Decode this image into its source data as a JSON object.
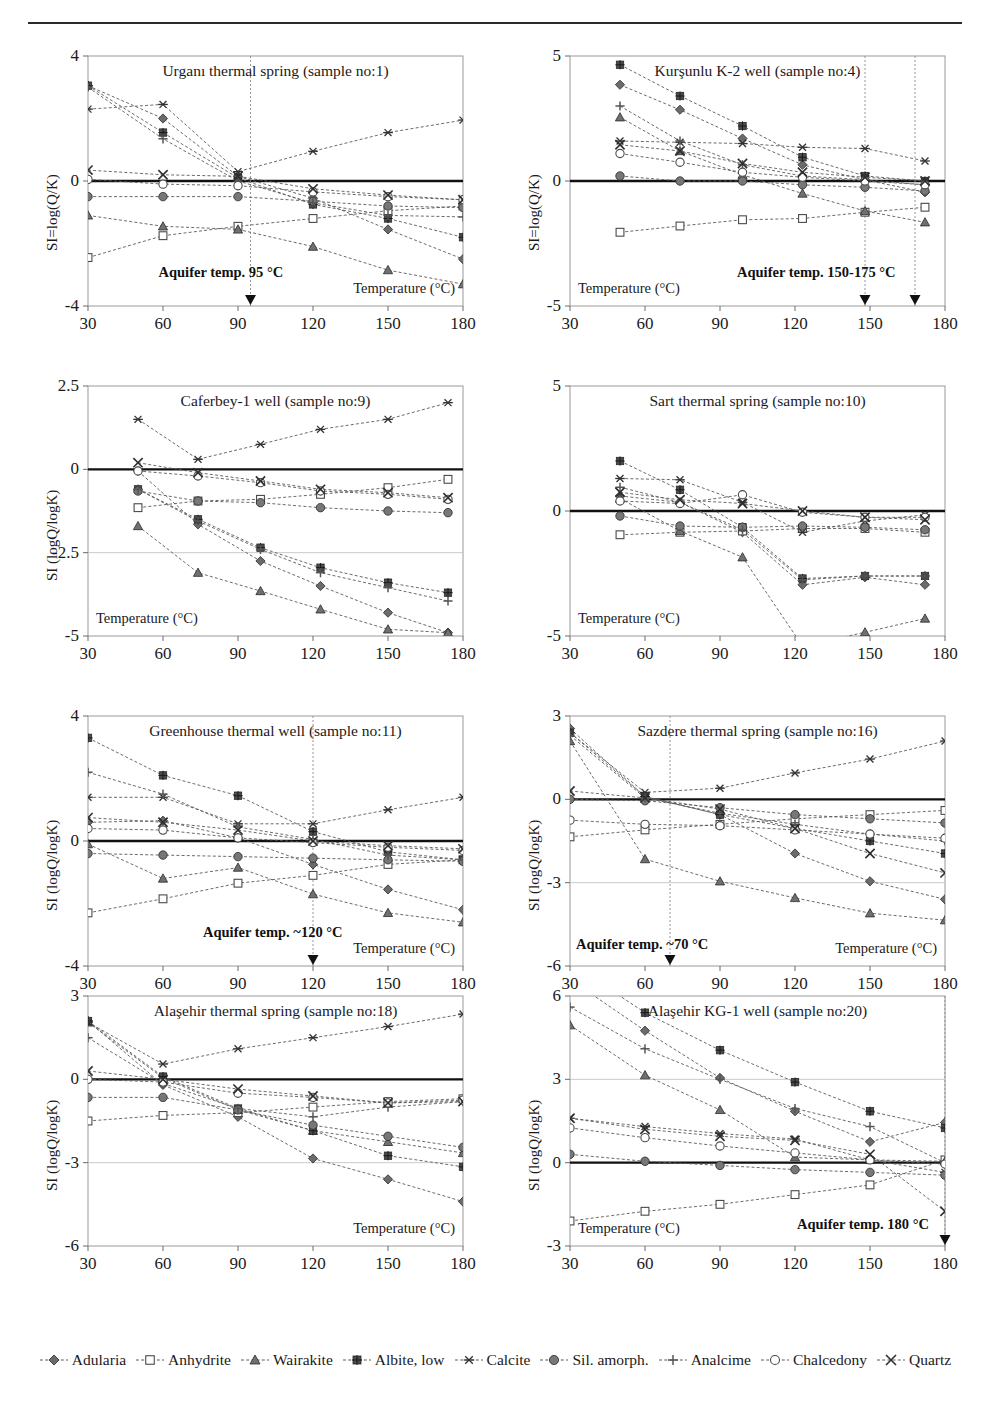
{
  "figure": {
    "xlabel": "Temperature (°C)",
    "x_ticks": [
      30,
      60,
      90,
      120,
      150,
      180
    ],
    "aquifer_prefix": "Aquifer temp."
  },
  "legend": {
    "items": [
      {
        "label": "Adularia",
        "marker": "diamond-filled",
        "color": "#6b6b6b"
      },
      {
        "label": "Anhydrite",
        "marker": "square-open",
        "color": "#8a8a8a"
      },
      {
        "label": "Wairakite",
        "marker": "triangle-filled",
        "color": "#707070"
      },
      {
        "label": "Albite, low",
        "marker": "square-star",
        "color": "#4a4a4a"
      },
      {
        "label": "Calcite",
        "marker": "asterisk",
        "color": "#333333"
      },
      {
        "label": "Sil. amorph.",
        "marker": "circle-filled",
        "color": "#777777"
      },
      {
        "label": "Analcime",
        "marker": "plus",
        "color": "#555555"
      },
      {
        "label": "Chalcedony",
        "marker": "circle-open",
        "color": "#8a8a8a"
      },
      {
        "label": "Quartz",
        "marker": "cross",
        "color": "#2e2e2e"
      }
    ]
  },
  "chart_data": [
    {
      "id": "urganli",
      "type": "line",
      "title": "Urganı thermal spring (sample no:1)",
      "xlabel": "Temperature (°C)",
      "ylabel": "SI=log(Q/K)",
      "xlim": [
        30,
        180
      ],
      "ylim": [
        -4,
        4
      ],
      "y_ticks": [
        -4,
        0,
        4
      ],
      "grid": true,
      "x": [
        30,
        60,
        90,
        120,
        150,
        180
      ],
      "aquifer": {
        "label": "Aquifer temp. 95 °C",
        "markers": [
          95
        ]
      },
      "series": [
        {
          "name": "Adularia",
          "values": [
            3.05,
            2.0,
            0.15,
            -0.55,
            -1.55,
            -2.5
          ]
        },
        {
          "name": "Anhydrite",
          "values": [
            -2.45,
            -1.75,
            -1.45,
            -1.2,
            -0.95,
            -0.8
          ]
        },
        {
          "name": "Wairakite",
          "values": [
            -1.1,
            -1.45,
            -1.55,
            -2.1,
            -2.85,
            -3.3
          ]
        },
        {
          "name": "Albite, low",
          "values": [
            3.05,
            1.55,
            0.1,
            -0.75,
            -1.2,
            -1.8
          ]
        },
        {
          "name": "Calcite",
          "values": [
            2.3,
            2.45,
            0.3,
            0.95,
            1.55,
            1.95
          ]
        },
        {
          "name": "Sil. amorph.",
          "values": [
            -0.5,
            -0.5,
            -0.5,
            -0.65,
            -0.8,
            -0.85
          ]
        },
        {
          "name": "Analcime",
          "values": [
            3.0,
            1.35,
            0.0,
            -0.7,
            -1.1,
            -1.15
          ]
        },
        {
          "name": "Chalcedony",
          "values": [
            0.05,
            -0.1,
            -0.15,
            -0.35,
            -0.5,
            -0.6
          ]
        },
        {
          "name": "Quartz",
          "values": [
            0.35,
            0.2,
            0.15,
            -0.25,
            -0.45,
            -0.6
          ]
        }
      ]
    },
    {
      "id": "kursunlu",
      "type": "line",
      "title": "Kurşunlu K-2 well (sample no:4)",
      "xlabel": "Temperature (°C)",
      "ylabel": "SI=log(Q/K)",
      "xlim": [
        30,
        180
      ],
      "ylim": [
        -5,
        5
      ],
      "y_ticks": [
        -5,
        0,
        5
      ],
      "grid": true,
      "x": [
        50,
        74,
        99,
        123,
        148,
        172
      ],
      "aquifer": {
        "label": "Aquifer temp. 150-175 °C",
        "markers": [
          148,
          168
        ]
      },
      "series": [
        {
          "name": "Adularia",
          "values": [
            3.85,
            2.85,
            1.7,
            0.65,
            0.05,
            -0.45
          ]
        },
        {
          "name": "Anhydrite",
          "values": [
            -2.05,
            -1.8,
            -1.55,
            -1.5,
            -1.25,
            -1.05
          ]
        },
        {
          "name": "Wairakite",
          "values": [
            2.55,
            1.2,
            0.25,
            -0.5,
            -1.2,
            -1.65
          ]
        },
        {
          "name": "Albite, low",
          "values": [
            4.65,
            3.4,
            2.2,
            0.95,
            0.2,
            0.0
          ]
        },
        {
          "name": "Calcite",
          "values": [
            1.6,
            1.55,
            1.5,
            1.35,
            1.3,
            0.8
          ]
        },
        {
          "name": "Sil. amorph.",
          "values": [
            0.2,
            0.0,
            0.0,
            -0.15,
            -0.25,
            -0.4
          ]
        },
        {
          "name": "Analcime",
          "values": [
            3.0,
            1.6,
            0.65,
            0.2,
            0.05,
            -0.15
          ]
        },
        {
          "name": "Chalcedony",
          "values": [
            1.1,
            0.75,
            0.35,
            0.15,
            0.0,
            -0.15
          ]
        },
        {
          "name": "Quartz",
          "values": [
            1.45,
            1.2,
            0.7,
            0.35,
            0.15,
            0.0
          ]
        }
      ]
    },
    {
      "id": "caferbey",
      "type": "line",
      "title": "Caferbey-1 well (sample no:9)",
      "xlabel": "Temperature (°C)",
      "ylabel": "SI (logQ/logK)",
      "xlim": [
        30,
        180
      ],
      "ylim": [
        -5,
        2.5
      ],
      "y_ticks": [
        -5,
        -2.5,
        0,
        2.5
      ],
      "grid": true,
      "x": [
        50,
        74,
        99,
        123,
        150,
        174
      ],
      "aquifer": null,
      "series": [
        {
          "name": "Adularia",
          "values": [
            -0.05,
            -1.65,
            -2.75,
            -3.5,
            -4.3,
            -4.9
          ]
        },
        {
          "name": "Anhydrite",
          "values": [
            -1.15,
            -0.95,
            -0.9,
            -0.75,
            -0.55,
            -0.3
          ]
        },
        {
          "name": "Wairakite",
          "values": [
            -1.7,
            -3.1,
            -3.65,
            -4.2,
            -4.8,
            -4.9
          ]
        },
        {
          "name": "Albite, low",
          "values": [
            -0.6,
            -1.5,
            -2.35,
            -2.95,
            -3.4,
            -3.7
          ]
        },
        {
          "name": "Calcite",
          "values": [
            1.5,
            0.3,
            0.75,
            1.2,
            1.5,
            2.0
          ]
        },
        {
          "name": "Sil. amorph.",
          "values": [
            -0.65,
            -0.95,
            -1.0,
            -1.15,
            -1.25,
            -1.3
          ]
        },
        {
          "name": "Analcime",
          "values": [
            -0.6,
            -1.55,
            -2.4,
            -3.1,
            -3.55,
            -3.95
          ]
        },
        {
          "name": "Chalcedony",
          "values": [
            -0.05,
            -0.2,
            -0.4,
            -0.65,
            -0.75,
            -0.9
          ]
        },
        {
          "name": "Quartz",
          "values": [
            0.2,
            -0.1,
            -0.35,
            -0.6,
            -0.7,
            -0.85
          ]
        }
      ]
    },
    {
      "id": "sart",
      "type": "line",
      "title": "Sart thermal spring (sample no:10)",
      "xlabel": "Temperature (°C)",
      "ylabel": "",
      "xlim": [
        30,
        180
      ],
      "ylim": [
        -5,
        5
      ],
      "y_ticks": [
        -5,
        0,
        5
      ],
      "grid": true,
      "x": [
        50,
        74,
        99,
        123,
        148,
        172
      ],
      "aquifer": null,
      "series": [
        {
          "name": "Adularia",
          "values": [
            0.6,
            0.35,
            -0.85,
            -2.95,
            -2.65,
            -2.95
          ]
        },
        {
          "name": "Anhydrite",
          "values": [
            -0.95,
            -0.85,
            -0.8,
            -0.7,
            -0.7,
            -0.85
          ]
        },
        {
          "name": "Wairakite",
          "values": [
            0.5,
            -0.8,
            -1.85,
            -5.4,
            -4.85,
            -4.3
          ]
        },
        {
          "name": "Albite, low",
          "values": [
            2.0,
            0.85,
            -0.65,
            -2.7,
            -2.6,
            -2.6
          ]
        },
        {
          "name": "Calcite",
          "values": [
            1.3,
            1.25,
            0.35,
            -0.85,
            -0.4,
            -0.15
          ]
        },
        {
          "name": "Sil. amorph.",
          "values": [
            -0.2,
            -0.6,
            -0.65,
            -0.6,
            -0.65,
            -0.75
          ]
        },
        {
          "name": "Analcime",
          "values": [
            0.95,
            0.35,
            -0.75,
            -2.75,
            -2.6,
            -2.6
          ]
        },
        {
          "name": "Chalcedony",
          "values": [
            0.4,
            0.3,
            0.65,
            -0.05,
            -0.25,
            -0.25
          ]
        },
        {
          "name": "Quartz",
          "values": [
            0.75,
            0.45,
            0.3,
            0.0,
            -0.25,
            -0.35
          ]
        }
      ]
    },
    {
      "id": "greenhouse",
      "type": "line",
      "title": "Greenhouse  thermal well (sample no:11)",
      "xlabel": "Temperature (°C)",
      "ylabel": "SI (logQ/logK)",
      "xlim": [
        30,
        180
      ],
      "ylim": [
        -4,
        4
      ],
      "y_ticks": [
        -4,
        0,
        4
      ],
      "grid": true,
      "x": [
        30,
        60,
        90,
        120,
        150,
        180
      ],
      "aquifer": {
        "label": "Aquifer temp.  ~120 °C",
        "markers": [
          120
        ]
      },
      "series": [
        {
          "name": "Adularia",
          "values": [
            0.6,
            0.65,
            0.1,
            -0.75,
            -1.55,
            -2.2
          ]
        },
        {
          "name": "Anhydrite",
          "values": [
            -2.3,
            -1.85,
            -1.35,
            -1.1,
            -0.75,
            -0.6
          ]
        },
        {
          "name": "Wairakite",
          "values": [
            -0.1,
            -1.2,
            -0.85,
            -1.7,
            -2.3,
            -2.6
          ]
        },
        {
          "name": "Albite, low",
          "values": [
            3.3,
            2.1,
            1.45,
            0.3,
            -0.35,
            -0.6
          ]
        },
        {
          "name": "Calcite",
          "values": [
            1.4,
            1.4,
            0.55,
            0.55,
            1.0,
            1.4
          ]
        },
        {
          "name": "Sil. amorph.",
          "values": [
            -0.4,
            -0.45,
            -0.5,
            -0.55,
            -0.6,
            -0.65
          ]
        },
        {
          "name": "Analcime",
          "values": [
            2.2,
            1.5,
            0.45,
            0.05,
            -0.45,
            -0.6
          ]
        },
        {
          "name": "Chalcedony",
          "values": [
            0.4,
            0.35,
            0.1,
            -0.05,
            -0.2,
            -0.3
          ]
        },
        {
          "name": "Quartz",
          "values": [
            0.75,
            0.6,
            0.35,
            0.0,
            -0.15,
            -0.25
          ]
        }
      ]
    },
    {
      "id": "sazdere",
      "type": "line",
      "title": "Sazdere thermal spring (sample no:16)",
      "xlabel": "Temperature (°C)",
      "ylabel": "SI (logQ/logK)",
      "xlim": [
        30,
        180
      ],
      "ylim": [
        -6,
        3
      ],
      "y_ticks": [
        -6,
        -3,
        0,
        3
      ],
      "grid": true,
      "x": [
        30,
        60,
        90,
        120,
        150,
        180
      ],
      "aquifer": {
        "label": "Aquifer temp.  ~70 °C",
        "markers": [
          70
        ]
      },
      "series": [
        {
          "name": "Adularia",
          "values": [
            2.55,
            0.1,
            -0.55,
            -1.95,
            -2.95,
            -3.6
          ]
        },
        {
          "name": "Anhydrite",
          "values": [
            -1.35,
            -1.1,
            -0.9,
            -0.7,
            -0.55,
            -0.4
          ]
        },
        {
          "name": "Wairakite",
          "values": [
            2.1,
            -2.15,
            -2.95,
            -3.55,
            -4.1,
            -4.35
          ]
        },
        {
          "name": "Albite, low",
          "values": [
            2.4,
            0.1,
            -0.55,
            -1.05,
            -1.5,
            -1.95
          ]
        },
        {
          "name": "Calcite",
          "values": [
            2.4,
            0.25,
            0.4,
            0.95,
            1.45,
            2.1
          ]
        },
        {
          "name": "Sil. amorph.",
          "values": [
            0.0,
            -0.05,
            -0.3,
            -0.55,
            -0.7,
            -0.85
          ]
        },
        {
          "name": "Analcime",
          "values": [
            2.3,
            0.05,
            -0.5,
            -0.9,
            -1.25,
            -1.5
          ]
        },
        {
          "name": "Chalcedony",
          "values": [
            -0.75,
            -0.9,
            -0.95,
            -1.1,
            -1.25,
            -1.4
          ]
        },
        {
          "name": "Quartz",
          "values": [
            0.3,
            0.05,
            -0.35,
            -1.05,
            -1.95,
            -2.65
          ]
        }
      ]
    },
    {
      "id": "alasehir-spring",
      "type": "line",
      "title": "Alaşehir thermal spring (sample no:18)",
      "xlabel": "Temperature (°C)",
      "ylabel": "SI (logQ/logK)",
      "xlim": [
        30,
        180
      ],
      "ylim": [
        -6,
        3
      ],
      "y_ticks": [
        -6,
        -3,
        0,
        3
      ],
      "grid": true,
      "x": [
        30,
        60,
        90,
        120,
        150,
        180
      ],
      "aquifer": null,
      "series": [
        {
          "name": "Adularia",
          "values": [
            2.1,
            -0.2,
            -1.35,
            -2.85,
            -3.6,
            -4.4
          ]
        },
        {
          "name": "Anhydrite",
          "values": [
            -1.5,
            -1.3,
            -1.2,
            -1.0,
            -0.8,
            -0.7
          ]
        },
        {
          "name": "Wairakite",
          "values": [
            2.05,
            0.05,
            -1.1,
            -1.85,
            -2.25,
            -2.65
          ]
        },
        {
          "name": "Albite, low",
          "values": [
            2.1,
            0.1,
            -1.05,
            -1.85,
            -2.75,
            -3.15
          ]
        },
        {
          "name": "Calcite",
          "values": [
            2.05,
            0.55,
            1.1,
            1.5,
            1.9,
            2.35
          ]
        },
        {
          "name": "Sil. amorph.",
          "values": [
            -0.65,
            -0.65,
            -1.1,
            -1.65,
            -2.05,
            -2.45
          ]
        },
        {
          "name": "Analcime",
          "values": [
            1.5,
            -0.15,
            -1.05,
            -1.35,
            -1.0,
            -0.8
          ]
        },
        {
          "name": "Chalcedony",
          "values": [
            0.0,
            -0.1,
            -0.5,
            -0.65,
            -0.85,
            -0.75
          ]
        },
        {
          "name": "Quartz",
          "values": [
            0.3,
            0.0,
            -0.35,
            -0.6,
            -0.85,
            -0.8
          ]
        }
      ]
    },
    {
      "id": "alasehir-kg1",
      "type": "line",
      "title": "Alaşehir KG-1 well (sample no:20)",
      "xlabel": "Temperature (°C)",
      "ylabel": "SI (logQ/logK)",
      "xlim": [
        30,
        180
      ],
      "ylim": [
        -3,
        6
      ],
      "y_ticks": [
        -3,
        0,
        3,
        6
      ],
      "grid": true,
      "x": [
        30,
        60,
        90,
        120,
        150,
        180
      ],
      "aquifer": {
        "label": "Aquifer temp. 180 °C",
        "markers": [
          180
        ]
      },
      "series": [
        {
          "name": "Adularia",
          "values": [
            6.6,
            4.75,
            3.05,
            1.85,
            0.75,
            1.45
          ]
        },
        {
          "name": "Anhydrite",
          "values": [
            -2.1,
            -1.75,
            -1.5,
            -1.15,
            -0.8,
            0.1
          ]
        },
        {
          "name": "Wairakite",
          "values": [
            4.95,
            3.15,
            1.9,
            0.2,
            0.1,
            0.05
          ]
        },
        {
          "name": "Albite, low",
          "values": [
            7.2,
            5.4,
            4.05,
            2.9,
            1.85,
            1.25
          ]
        },
        {
          "name": "Calcite",
          "values": [
            1.6,
            1.3,
            1.05,
            0.85,
            0.1,
            -0.35
          ]
        },
        {
          "name": "Sil. amorph.",
          "values": [
            0.3,
            0.05,
            -0.1,
            -0.25,
            -0.35,
            -0.45
          ]
        },
        {
          "name": "Analcime",
          "values": [
            5.6,
            4.1,
            3.0,
            1.95,
            1.3,
            0.0
          ]
        },
        {
          "name": "Chalcedony",
          "values": [
            1.25,
            0.9,
            0.6,
            0.35,
            0.1,
            -0.05
          ]
        },
        {
          "name": "Quartz",
          "values": [
            1.6,
            1.2,
            0.95,
            0.8,
            0.3,
            -1.75
          ]
        }
      ]
    }
  ]
}
